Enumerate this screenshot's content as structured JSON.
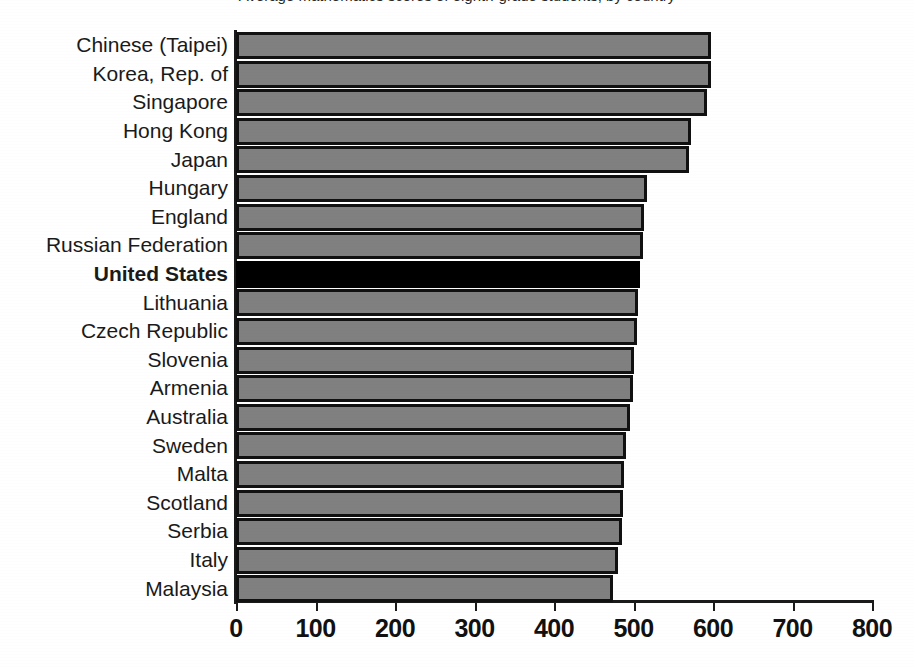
{
  "chart_data": {
    "type": "bar",
    "orientation": "horizontal",
    "title": "Average mathematics scores of eighth-grade students, by country",
    "xlabel": "",
    "ylabel": "",
    "xlim": [
      0,
      800
    ],
    "xticks": [
      0,
      100,
      200,
      300,
      400,
      500,
      600,
      700,
      800
    ],
    "xtick_labels": [
      "0",
      "100",
      "200",
      "300",
      "400",
      "500",
      "600",
      "700",
      "800"
    ],
    "grid": false,
    "legend": "none",
    "highlight_category": "United States",
    "bar_fill_color": "#808080",
    "bar_edge_color": "#111111",
    "highlight_fill_color": "#000000",
    "categories": [
      "Chinese (Taipei)",
      "Korea, Rep. of",
      "Singapore",
      "Hong Kong",
      "Japan",
      "Hungary",
      "England",
      "Russian Federation",
      "United States",
      "Lithuania",
      "Czech Republic",
      "Slovenia",
      "Armenia",
      "Australia",
      "Sweden",
      "Malta",
      "Scotland",
      "Serbia",
      "Italy",
      "Malaysia"
    ],
    "values": [
      598,
      597,
      593,
      572,
      570,
      517,
      513,
      512,
      508,
      506,
      504,
      501,
      499,
      496,
      491,
      488,
      487,
      486,
      480,
      474
    ]
  }
}
